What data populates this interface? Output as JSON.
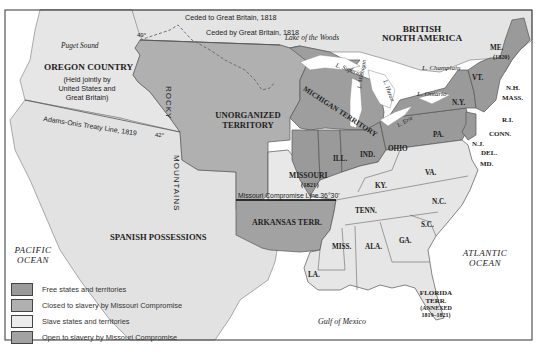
{
  "map": {
    "title_regions": {
      "british_north_america": [
        "BRITISH",
        "NORTH AMERICA"
      ],
      "oregon_country": "OREGON COUNTRY",
      "oregon_note": [
        "(Held jointly by",
        "United States and",
        "Great Britain)"
      ],
      "unorganized_territory": [
        "UNORGANIZED",
        "TERRITORY"
      ],
      "michigan_territory": "MICHIGAN TERRITORY",
      "spanish_possessions": "SPANISH POSSESSIONS",
      "arkansas_terr": "ARKANSAS TERR.",
      "missouri": "MISSOURI",
      "missouri_year": "(1821)",
      "florida": [
        "FLORIDA",
        "TERR.",
        "(ANNEXED",
        "1819–1821)"
      ],
      "maine": "ME.",
      "maine_year": "(1820)"
    },
    "mountains": {
      "rocky": "ROCKY",
      "mountains": "MOUNTAINS"
    },
    "states": {
      "ill": "ILL.",
      "ind": "IND.",
      "ohio": "OHIO",
      "pa": "PA.",
      "ny": "N.Y.",
      "vt": "VT.",
      "nh": "N.H.",
      "mass": "MASS.",
      "ri": "R.I.",
      "conn": "CONN.",
      "nj": "N.J.",
      "del": "DEL.",
      "md": "MD.",
      "va": "VA.",
      "ky": "KY.",
      "tenn": "TENN.",
      "nc": "N.C.",
      "sc": "S.C.",
      "ga": "GA.",
      "ala": "ALA.",
      "miss": "MISS.",
      "la": "LA."
    },
    "water": {
      "pacific": [
        "PACIFIC",
        "OCEAN"
      ],
      "atlantic": [
        "ATLANTIC",
        "OCEAN"
      ],
      "gulf": "Gulf of Mexico",
      "puget": "Puget Sound",
      "lake_woods": "Lake of the Woods",
      "superior": "L. Superior",
      "michigan": "L. Michigan",
      "huron": "L. Huron",
      "erie": "L. Erie",
      "ontario": "L. Ontario",
      "champlain": "L. Champlain"
    },
    "annotations": {
      "ceded_to": "Ceded to Great Britain, 1818",
      "ceded_by": "Ceded by Great Britain, 1818",
      "adams_onis": "Adams-Onis Treaty Line, 1819",
      "compromise_line": "Missouri Compromise Line 36°30'",
      "lat49": "49°",
      "lat42": "42°"
    },
    "colors": {
      "free": "#9a9a9a",
      "closed": "#b0b0b0",
      "slave": "#e6e6e6",
      "open": "#a2a2a2",
      "foreign": "#e2e2e2",
      "water": "#ffffff",
      "border": "#555555"
    }
  },
  "legend": {
    "items": [
      {
        "label": "Free states and territories",
        "color": "#9a9a9a"
      },
      {
        "label": "Closed to slavery by Missouri Compromise",
        "color": "#b0b0b0"
      },
      {
        "label": "Slave states and territories",
        "color": "#e6e6e6"
      },
      {
        "label": "Open to slavery by Missouri Compromise",
        "color": "#a2a2a2"
      }
    ]
  }
}
